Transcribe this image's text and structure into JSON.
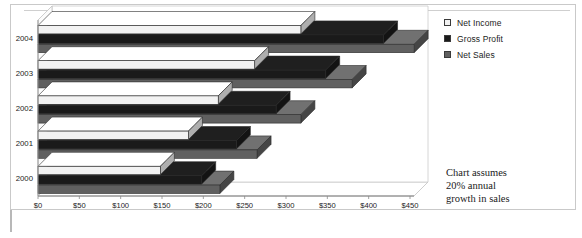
{
  "legend": {
    "items": [
      {
        "label": "Net Income",
        "color": "#f2f2f2",
        "marker": "square-outline-icon"
      },
      {
        "label": "Gross Profit",
        "color": "#1a1a1a",
        "marker": "square-filled-icon"
      },
      {
        "label": "Net Sales",
        "color": "#606060",
        "marker": "square-gray-icon"
      }
    ]
  },
  "annotation": {
    "line1": "Chart assumes",
    "line2": "20% annual",
    "line3": "growth in sales"
  },
  "chart_data": {
    "type": "bar",
    "orientation": "horizontal",
    "style": "3d-clustered-bar",
    "title": "",
    "xlabel": "",
    "ylabel": "",
    "categories": [
      "2000",
      "2001",
      "2002",
      "2003",
      "2004"
    ],
    "xlim": [
      0,
      450
    ],
    "xticks": [
      0,
      50,
      100,
      150,
      200,
      250,
      300,
      350,
      400,
      450
    ],
    "xticklabels": [
      "$0",
      "$50",
      "$100",
      "$150",
      "$200",
      "$250",
      "$300",
      "$350",
      "$400",
      "$450"
    ],
    "grid": false,
    "legend_position": "right-top",
    "series": [
      {
        "name": "Net Income",
        "color": "#f2f2f2",
        "values": [
          148,
          182,
          218,
          262,
          318
        ]
      },
      {
        "name": "Gross Profit",
        "color": "#1a1a1a",
        "values": [
          198,
          240,
          288,
          348,
          418
        ]
      },
      {
        "name": "Net Sales",
        "color": "#606060",
        "values": [
          220,
          265,
          318,
          380,
          455
        ]
      }
    ]
  }
}
